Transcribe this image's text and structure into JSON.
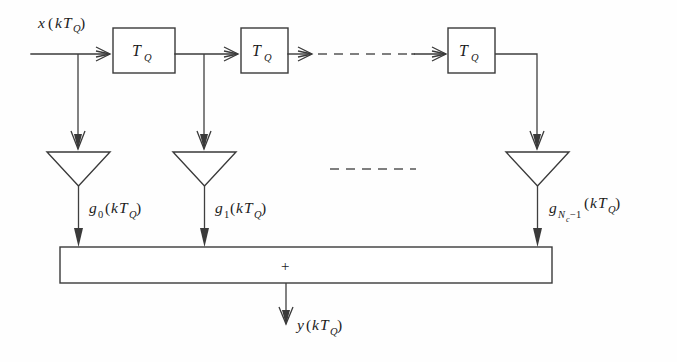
{
  "figure": {
    "line_color": "#3a3a3a",
    "text_color": "#1c1c1c",
    "background": "#fefefe"
  },
  "input": {
    "label_base": "x",
    "label_paren_open": "(",
    "label_k": "k",
    "label_T": "T",
    "label_T_sub": "Q",
    "label_paren_close": ")",
    "label_full": "x(kTQ)"
  },
  "delay_blocks": [
    {
      "id": "delay-1",
      "label_T": "T",
      "label_sub": "Q"
    },
    {
      "id": "delay-2",
      "label_T": "T",
      "label_sub": "Q"
    },
    {
      "id": "delay-3",
      "label_T": "T",
      "label_sub": "Q"
    }
  ],
  "taps": [
    {
      "id": "tap-0",
      "gain_symbol": "g",
      "gain_sub": "0",
      "gain_sub_c": "",
      "gain_sub_tail": "",
      "arg_open": "(",
      "arg_k": "k",
      "arg_T": "T",
      "arg_T_sub": "Q",
      "arg_close": ")",
      "label_full": "g0(kTQ)"
    },
    {
      "id": "tap-1",
      "gain_symbol": "g",
      "gain_sub": "1",
      "gain_sub_c": "",
      "gain_sub_tail": "",
      "arg_open": "(",
      "arg_k": "k",
      "arg_T": "T",
      "arg_T_sub": "Q",
      "arg_close": ")",
      "label_full": "g1(kTQ)"
    },
    {
      "id": "tap-last",
      "gain_symbol": "g",
      "gain_sub": "N",
      "gain_sub_c": "c",
      "gain_sub_tail": "−1",
      "arg_open": "(",
      "arg_k": "k",
      "arg_T": "T",
      "arg_T_sub": "Q",
      "arg_close": ")",
      "label_full": "gNc−1(kTQ)"
    }
  ],
  "summation": {
    "symbol": "+",
    "name": "adder-bar"
  },
  "output": {
    "label_base": "y",
    "label_paren_open": "(",
    "label_k": "k",
    "label_T": "T",
    "label_T_sub": "Q",
    "label_paren_close": ")",
    "label_full": "y(kTQ)"
  },
  "ellipses": {
    "top_continuation": "dashed-line",
    "middle_continuation": "dashed-line"
  }
}
